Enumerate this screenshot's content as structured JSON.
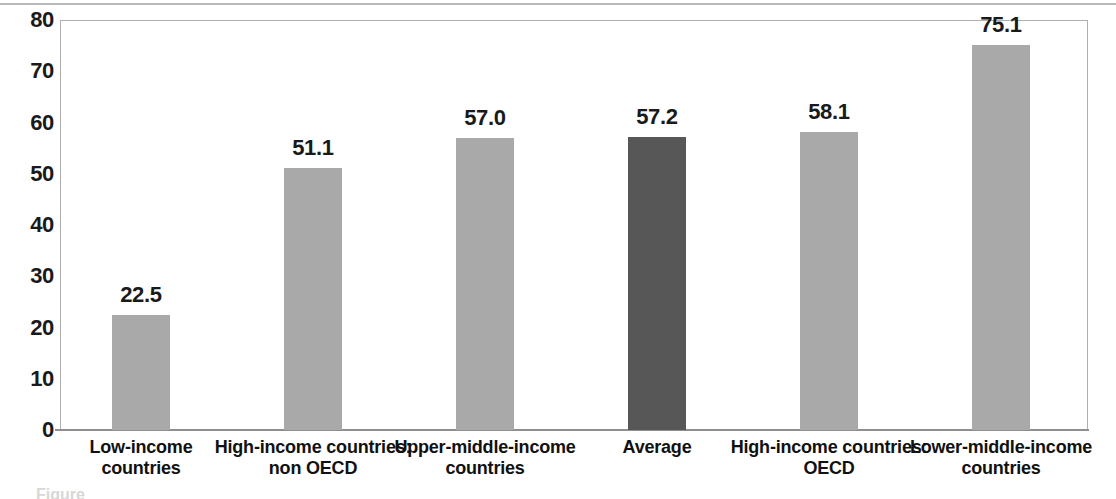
{
  "chart_data": {
    "type": "bar",
    "title": "",
    "xlabel": "",
    "ylabel": "",
    "ylim": [
      0,
      80
    ],
    "ytick_step": 10,
    "yticks": [
      "80",
      "70",
      "60",
      "50",
      "40",
      "30",
      "20",
      "10",
      "0"
    ],
    "grid": false,
    "legend": "none",
    "categories": [
      "Low-income countries",
      "High-income countries: non OECD",
      "Upper-middle-income countries",
      "Average",
      "High-income countries: OECD",
      "Lower-middle-income countries"
    ],
    "category_lines": [
      [
        "Low-income",
        "countries"
      ],
      [
        "High-income countries:",
        "non OECD"
      ],
      [
        "Upper-middle-income",
        "countries"
      ],
      [
        "Average"
      ],
      [
        "High-income countries:",
        "OECD"
      ],
      [
        "Lower-middle-income",
        "countries"
      ]
    ],
    "values": [
      22.5,
      51.1,
      57.0,
      57.2,
      58.1,
      75.1
    ],
    "value_labels": [
      "22.5",
      "51.1",
      "57.0",
      "57.2",
      "58.1",
      "75.1"
    ],
    "bar_colors": [
      "#a9a9a9",
      "#a9a9a9",
      "#a9a9a9",
      "#575757",
      "#a9a9a9",
      "#a9a9a9"
    ],
    "highlight_index": 3,
    "colors": {
      "bar_default": "#a9a9a9",
      "bar_highlight": "#575757",
      "axis": "#8f8f8f",
      "frame": "#b0b0b0",
      "text": "#1a1a1a"
    }
  },
  "caption_bleed": "Figure"
}
